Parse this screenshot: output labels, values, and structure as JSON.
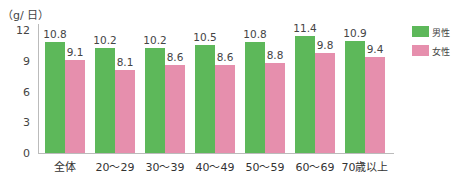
{
  "chart_data": {
    "type": "bar",
    "title": "",
    "unit_label": "（g/ 日）",
    "xlabel": "",
    "ylabel": "（g/ 日）",
    "ylim": [
      0,
      12
    ],
    "yticks": [
      "0",
      "3",
      "6",
      "9",
      "12"
    ],
    "grid": false,
    "legend_position": "right",
    "categories": [
      "全体",
      "20〜29",
      "30〜39",
      "40〜49",
      "50〜59",
      "60〜69",
      "70歳以上"
    ],
    "series": [
      {
        "name": "男性",
        "color": "#5db85a",
        "values": [
          10.8,
          10.2,
          10.2,
          10.5,
          10.8,
          11.4,
          10.9
        ],
        "labels": [
          "10.8",
          "10.2",
          "10.2",
          "10.5",
          "10.8",
          "11.4",
          "10.9"
        ]
      },
      {
        "name": "女性",
        "color": "#e68fad",
        "values": [
          9.1,
          8.1,
          8.6,
          8.6,
          8.8,
          9.8,
          9.4
        ],
        "labels": [
          "9.1",
          "8.1",
          "8.6",
          "8.6",
          "8.8",
          "9.8",
          "9.4"
        ]
      }
    ]
  }
}
